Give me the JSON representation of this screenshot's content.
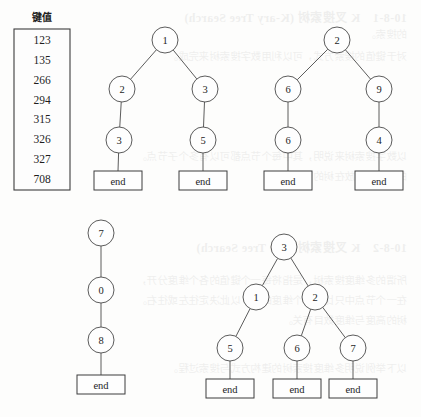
{
  "figure": {
    "background_color": "#fdfdfc",
    "ink_color": "#3d3d3d",
    "end_label": "end"
  },
  "key_list": {
    "title": "键值",
    "values": [
      "123",
      "135",
      "266",
      "294",
      "315",
      "326",
      "327",
      "708"
    ]
  },
  "trees": [
    {
      "id": "tree-1",
      "nodes": [
        {
          "id": "t1-root",
          "label": "1",
          "cx": 165,
          "cy": 40
        },
        {
          "id": "t1-l",
          "label": "2",
          "cx": 122,
          "cy": 89
        },
        {
          "id": "t1-r",
          "label": "3",
          "cx": 205,
          "cy": 89
        },
        {
          "id": "t1-ll",
          "label": "3",
          "cx": 119,
          "cy": 140
        },
        {
          "id": "t1-rr",
          "label": "5",
          "cx": 203,
          "cy": 140
        }
      ],
      "edges": [
        {
          "from": "t1-root",
          "to": "t1-l"
        },
        {
          "from": "t1-root",
          "to": "t1-r"
        },
        {
          "from": "t1-l",
          "to": "t1-ll"
        },
        {
          "from": "t1-r",
          "to": "t1-rr"
        }
      ],
      "terminals": [
        {
          "id": "t1-end-1",
          "parent": "t1-ll",
          "x": 94,
          "y": 171,
          "w": 48,
          "h": 19
        },
        {
          "id": "t1-end-2",
          "parent": "t1-rr",
          "x": 179,
          "y": 171,
          "w": 48,
          "h": 19
        }
      ]
    },
    {
      "id": "tree-2",
      "nodes": [
        {
          "id": "t2-root",
          "label": "2",
          "cx": 337,
          "cy": 40
        },
        {
          "id": "t2-l",
          "label": "6",
          "cx": 288,
          "cy": 89
        },
        {
          "id": "t2-r",
          "label": "9",
          "cx": 379,
          "cy": 89
        },
        {
          "id": "t2-ll",
          "label": "6",
          "cx": 288,
          "cy": 140
        },
        {
          "id": "t2-rr",
          "label": "4",
          "cx": 379,
          "cy": 140
        }
      ],
      "edges": [
        {
          "from": "t2-root",
          "to": "t2-l"
        },
        {
          "from": "t2-root",
          "to": "t2-r"
        },
        {
          "from": "t2-l",
          "to": "t2-ll"
        },
        {
          "from": "t2-r",
          "to": "t2-rr"
        }
      ],
      "terminals": [
        {
          "id": "t2-end-1",
          "parent": "t2-ll",
          "x": 264,
          "y": 171,
          "w": 48,
          "h": 19
        },
        {
          "id": "t2-end-2",
          "parent": "t2-rr",
          "x": 355,
          "y": 171,
          "w": 48,
          "h": 19
        }
      ]
    },
    {
      "id": "tree-3",
      "nodes": [
        {
          "id": "t3-root",
          "label": "7",
          "cx": 101,
          "cy": 233
        },
        {
          "id": "t3-mid",
          "label": "0",
          "cx": 101,
          "cy": 290
        },
        {
          "id": "t3-low",
          "label": "8",
          "cx": 101,
          "cy": 340
        }
      ],
      "edges": [
        {
          "from": "t3-root",
          "to": "t3-mid"
        },
        {
          "from": "t3-mid",
          "to": "t3-low"
        }
      ],
      "terminals": [
        {
          "id": "t3-end-1",
          "parent": "t3-low",
          "x": 77,
          "y": 375,
          "w": 48,
          "h": 19
        }
      ]
    },
    {
      "id": "tree-4",
      "nodes": [
        {
          "id": "t4-root",
          "label": "3",
          "cx": 284,
          "cy": 247
        },
        {
          "id": "t4-l",
          "label": "1",
          "cx": 256,
          "cy": 297
        },
        {
          "id": "t4-r",
          "label": "2",
          "cx": 315,
          "cy": 297
        },
        {
          "id": "t4-ll",
          "label": "5",
          "cx": 230,
          "cy": 348
        },
        {
          "id": "t4-rl",
          "label": "6",
          "cx": 297,
          "cy": 348
        },
        {
          "id": "t4-rr",
          "label": "7",
          "cx": 353,
          "cy": 348
        }
      ],
      "edges": [
        {
          "from": "t4-root",
          "to": "t4-l"
        },
        {
          "from": "t4-root",
          "to": "t4-r"
        },
        {
          "from": "t4-l",
          "to": "t4-ll"
        },
        {
          "from": "t4-r",
          "to": "t4-rl"
        },
        {
          "from": "t4-r",
          "to": "t4-rr"
        }
      ],
      "terminals": [
        {
          "id": "t4-end-1",
          "parent": "t4-ll",
          "x": 206,
          "y": 379,
          "w": 48,
          "h": 19
        },
        {
          "id": "t4-end-2",
          "parent": "t4-rl",
          "x": 273,
          "y": 379,
          "w": 48,
          "h": 19
        },
        {
          "id": "t4-end-3",
          "parent": "t4-rr",
          "x": 329,
          "y": 379,
          "w": 48,
          "h": 19
        }
      ]
    }
  ]
}
